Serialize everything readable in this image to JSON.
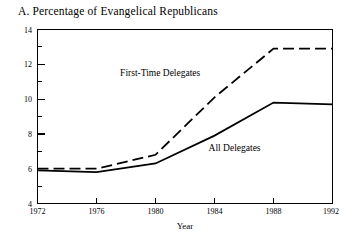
{
  "chart_data": {
    "type": "line",
    "title": "A. Percentage of Evangelical Republicans",
    "xlabel": "Year",
    "ylabel": "",
    "x": [
      1972,
      1976,
      1980,
      1984,
      1988,
      1992
    ],
    "xtick_labels": [
      "1972",
      "1976",
      "1980",
      "1984",
      "1988",
      "1992"
    ],
    "ytick_labels": [
      "4",
      "6",
      "8",
      "10",
      "12",
      "14"
    ],
    "ytick_values": [
      4,
      6,
      8,
      10,
      12,
      14
    ],
    "yminor_values": [
      5,
      7,
      9,
      11,
      13
    ],
    "xlim": [
      1972,
      1992
    ],
    "ylim": [
      4,
      14
    ],
    "grid": false,
    "legend_position": "inline-annotation",
    "series": [
      {
        "name": "First-Time Delegates",
        "style": "dashed",
        "color": "#000000",
        "values": [
          6.0,
          6.0,
          6.8,
          10.1,
          12.9,
          12.9
        ],
        "label_x": 1977.6,
        "label_y": 11.3
      },
      {
        "name": "All Delegates",
        "style": "solid",
        "color": "#000000",
        "values": [
          5.9,
          5.8,
          6.3,
          7.9,
          9.8,
          9.7
        ],
        "label_x": 1983.6,
        "label_y": 7.0
      }
    ],
    "annotations": [
      {
        "text": "First-Time Delegates"
      },
      {
        "text": "All Delegates"
      }
    ]
  },
  "labels": {
    "series_first_time": "First-Time Delegates",
    "series_all": "All Delegates"
  }
}
